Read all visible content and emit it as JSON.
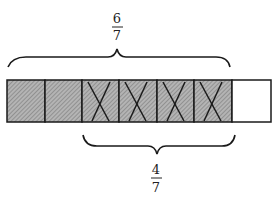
{
  "diagram": {
    "type": "fraction-bar-model",
    "total_parts": 7,
    "parts": [
      {
        "index": 1,
        "shaded": true,
        "crossed": false
      },
      {
        "index": 2,
        "shaded": true,
        "crossed": false
      },
      {
        "index": 3,
        "shaded": true,
        "crossed": true
      },
      {
        "index": 4,
        "shaded": true,
        "crossed": true
      },
      {
        "index": 5,
        "shaded": true,
        "crossed": true
      },
      {
        "index": 6,
        "shaded": true,
        "crossed": true
      },
      {
        "index": 7,
        "shaded": false,
        "crossed": false
      }
    ],
    "top_brace": {
      "spans_parts": [
        1,
        6
      ],
      "label": {
        "numerator": "6",
        "denominator": "7"
      }
    },
    "bottom_brace": {
      "spans_parts": [
        3,
        6
      ],
      "label": {
        "numerator": "4",
        "denominator": "7"
      }
    },
    "colors": {
      "stroke": "#1a1a1a",
      "shaded_fill": "#b4b4b4",
      "hatch_line": "#7a7a7a",
      "unshaded_fill": "#ffffff"
    }
  }
}
